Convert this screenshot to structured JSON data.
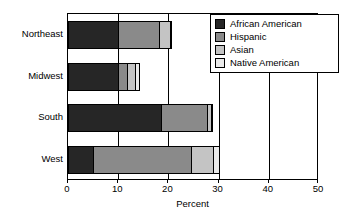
{
  "chart_data": {
    "type": "bar",
    "orientation": "horizontal",
    "stacked": true,
    "title": "",
    "xlabel": "Percent",
    "ylabel": "",
    "xlim": [
      0,
      50
    ],
    "xticks": [
      0,
      10,
      20,
      30,
      40,
      50
    ],
    "xtick_labels": [
      "0",
      "10",
      "20",
      "30",
      "40",
      "50"
    ],
    "grid": false,
    "legend_position": "upper right",
    "categories": [
      "Northeast",
      "Midwest",
      "South",
      "West"
    ],
    "series": [
      {
        "name": "African American",
        "color": "#262626",
        "values": [
          10.2,
          10.2,
          18.7,
          5.2
        ]
      },
      {
        "name": "Hispanic",
        "color": "#8a8a8a",
        "values": [
          8.4,
          2.0,
          9.4,
          19.7
        ]
      },
      {
        "name": "Asian",
        "color": "#c4c4c4",
        "values": [
          2.4,
          1.8,
          0.9,
          4.6
        ]
      },
      {
        "name": "Native American",
        "color": "#eaeaea",
        "values": [
          0.2,
          1.0,
          0.5,
          1.4
        ]
      }
    ],
    "totals": [
      21.2,
      15.0,
      29.5,
      30.9
    ]
  },
  "axis": {
    "x_title": "Percent",
    "tick_labels": [
      "0",
      "10",
      "20",
      "30",
      "40",
      "50"
    ]
  },
  "legend": {
    "items": [
      {
        "label": "African American",
        "color": "#262626"
      },
      {
        "label": "Hispanic",
        "color": "#8a8a8a"
      },
      {
        "label": "Asian",
        "color": "#c4c4c4"
      },
      {
        "label": "Native American",
        "color": "#eaeaea"
      }
    ]
  },
  "categories": [
    {
      "label": "Northeast"
    },
    {
      "label": "Midwest"
    },
    {
      "label": "South"
    },
    {
      "label": "West"
    }
  ]
}
